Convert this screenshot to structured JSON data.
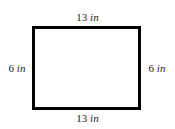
{
  "figure": {
    "shape": "rectangle",
    "stroke_color": "#000000",
    "fill_color": "#ffffff",
    "background_color": "#ffffff",
    "stroke_width_px": 3
  },
  "labels": {
    "top": {
      "value": "13",
      "unit": "in",
      "full": "13 in"
    },
    "bottom": {
      "value": "13",
      "unit": "in",
      "full": "13 in"
    },
    "left": {
      "value": "6",
      "unit": "in",
      "full": "6 in"
    },
    "right": {
      "value": "6",
      "unit": "in",
      "full": "6 in"
    }
  },
  "chart_data": {
    "type": "diagram",
    "shape": "rectangle",
    "title": "",
    "dimensions": {
      "width": {
        "value": 13,
        "unit": "in",
        "label": "13 in",
        "sides": [
          "top",
          "bottom"
        ]
      },
      "height": {
        "value": 6,
        "unit": "in",
        "label": "6 in",
        "sides": [
          "left",
          "right"
        ]
      }
    },
    "annotations": [
      "13 in",
      "6 in",
      "6 in",
      "13 in"
    ]
  }
}
